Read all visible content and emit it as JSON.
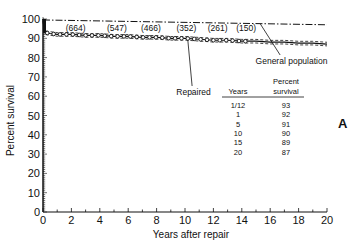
{
  "chart_data": {
    "type": "line",
    "title": "",
    "panel_label": "A",
    "xlabel": "Years after repair",
    "ylabel": "Percent survival",
    "xlim": [
      0,
      20
    ],
    "ylim": [
      0,
      100
    ],
    "xticks": [
      0,
      2,
      4,
      6,
      8,
      10,
      12,
      14,
      16,
      18,
      20
    ],
    "yticks": [
      0,
      10,
      20,
      30,
      40,
      50,
      60,
      70,
      80,
      90,
      100
    ],
    "grid": false,
    "series": [
      {
        "name": "Repaired",
        "style": "solid with circle markers, dashed confidence limits",
        "x": [
          0,
          0.083,
          0.5,
          1,
          2,
          3,
          4,
          5,
          6,
          7,
          8,
          9,
          10,
          11,
          12,
          13,
          14,
          15,
          16,
          17,
          18,
          19,
          20
        ],
        "values": [
          100,
          93,
          92.5,
          92,
          92,
          91.5,
          91.5,
          91,
          91,
          90.5,
          90.5,
          90,
          90,
          89.5,
          89,
          89,
          88.5,
          88.5,
          88,
          88,
          87.5,
          87.5,
          87
        ]
      },
      {
        "name": "General population",
        "style": "dash-dot",
        "x": [
          0,
          20
        ],
        "values": [
          99.5,
          97
        ]
      }
    ],
    "at_risk_annotations": [
      {
        "x": 2.3,
        "label": "(664)"
      },
      {
        "x": 5.2,
        "label": "(547)"
      },
      {
        "x": 7.6,
        "label": "(466)"
      },
      {
        "x": 10.1,
        "label": "(352)"
      },
      {
        "x": 12.3,
        "label": "(261)"
      },
      {
        "x": 14.3,
        "label": "(150)"
      }
    ],
    "callouts": {
      "repaired": "Repaired",
      "general_population": "General population"
    },
    "table": {
      "headers": [
        "Years",
        "Percent survival"
      ],
      "header_line1": [
        "",
        "Percent"
      ],
      "header_line2": [
        "Years",
        "survival"
      ],
      "rows": [
        [
          "1/12",
          "93"
        ],
        [
          "1",
          "92"
        ],
        [
          "5",
          "91"
        ],
        [
          "10",
          "90"
        ],
        [
          "15",
          "89"
        ],
        [
          "20",
          "87"
        ]
      ]
    }
  }
}
